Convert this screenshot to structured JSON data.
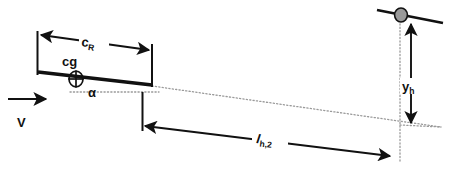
{
  "figure": {
    "background_color": "#ffffff",
    "line_color": "#111111",
    "dotted_color": "#9a9a9a",
    "marker_fill": "#9a9a9a",
    "width": 452,
    "height": 183
  },
  "labels": {
    "root_chord": {
      "symbol": "c",
      "subscript": "R",
      "full": "c_R"
    },
    "center_of_gravity": {
      "symbol": "cg",
      "full": "cg"
    },
    "angle_of_attack": {
      "symbol": "α",
      "full": "α"
    },
    "velocity": {
      "symbol": "V",
      "full": "V"
    },
    "tail_arm": {
      "symbol": "l",
      "subscript": "h,2",
      "full": "l_h,2"
    },
    "tail_height": {
      "symbol": "y",
      "subscript": "h",
      "full": "y_h"
    }
  },
  "elements": {
    "wing_chord_line": {
      "name": "wing-chord-line",
      "x1": 38,
      "y1": 72,
      "x2": 152,
      "y2": 85,
      "stroke_width": 3.2
    },
    "tail_chord_line": {
      "name": "tail-chord-line",
      "x1": 378,
      "y1": 10,
      "x2": 442,
      "y2": 23,
      "stroke_width": 2.6
    },
    "tail_aero_center_marker": {
      "name": "tail-aerodynamic-center-marker",
      "cx": 401,
      "cy": 15,
      "rx": 6.2,
      "ry": 6.8
    },
    "cg_marker": {
      "name": "cg-marker",
      "cx": 76,
      "cy": 79,
      "rx": 7.0,
      "ry": 7.6
    },
    "chord_dimension": {
      "name": "root-chord-dimension",
      "x1": 41,
      "y1": 35,
      "x2": 150,
      "y2": 50,
      "label_x": 93,
      "label_y": 46
    },
    "chord_extension_left": {
      "name": "chord-extension-line-left",
      "x1": 37,
      "y1": 31,
      "x2": 37,
      "y2": 75
    },
    "chord_extension_right": {
      "name": "chord-extension-line-right",
      "x1": 152,
      "y1": 44,
      "x2": 152,
      "y2": 86
    },
    "tail_arm_extension_left": {
      "name": "tail-arm-extension-line-left",
      "x1": 142,
      "y1": 92,
      "x2": 142,
      "y2": 130
    },
    "tail_arm_dimension": {
      "name": "tail-arm-dimension",
      "x1": 142,
      "y1": 126,
      "x2": 392,
      "y2": 157,
      "label_x": 268,
      "label_y": 143
    },
    "chord_reference_dotted": {
      "name": "extended-chord-reference-line",
      "x1": 152,
      "y1": 86,
      "x2": 440,
      "y2": 127
    },
    "alpha_reference_dotted": {
      "name": "horizontal-reference-line",
      "x1": 70,
      "y1": 92,
      "x2": 158,
      "y2": 92
    },
    "tail_vertical_dotted": {
      "name": "tail-station-vertical-line",
      "x1": 400,
      "y1": 16,
      "x2": 400,
      "y2": 160
    },
    "tail_height_dimension": {
      "name": "tail-height-dimension",
      "x1": 410,
      "y1": 22,
      "x2": 410,
      "y2": 124,
      "label_x": 412,
      "label_y": 88
    },
    "velocity_arrow": {
      "name": "freestream-velocity-arrow",
      "x1": 8,
      "y1": 99,
      "x2": 48,
      "y2": 99,
      "label_x": 22,
      "label_y": 124
    },
    "alpha_label": {
      "name": "angle-of-attack-label",
      "x": 91,
      "y": 95
    },
    "cg_label": {
      "name": "cg-label",
      "x": 62,
      "y": 65
    }
  }
}
